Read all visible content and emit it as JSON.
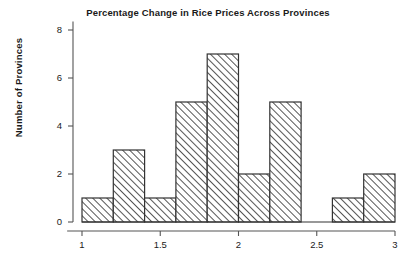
{
  "chart_data": {
    "type": "bar",
    "title": "Percentage Change in Rice Prices Across Provinces",
    "xlabel": "",
    "ylabel": "Number of Provinces",
    "bin_width": 0.2,
    "bin_edges": [
      1.0,
      1.2,
      1.4,
      1.6,
      1.8,
      2.0,
      2.2,
      2.4,
      2.6,
      2.8,
      3.0
    ],
    "categories": [
      "1.0-1.2",
      "1.2-1.4",
      "1.4-1.6",
      "1.6-1.8",
      "1.8-2.0",
      "2.0-2.2",
      "2.2-2.4",
      "2.4-2.6",
      "2.6-2.8",
      "2.8-3.0"
    ],
    "values": [
      1,
      3,
      1,
      5,
      7,
      2,
      5,
      0,
      1,
      2
    ],
    "xlim": [
      0.9,
      3.05
    ],
    "ylim": [
      0,
      8.35
    ],
    "xticks": [
      1,
      1.5,
      2,
      2.5,
      3
    ],
    "xtick_labels": [
      "1",
      "1.5",
      "2",
      "2.5",
      "3"
    ],
    "yticks": [
      0,
      2,
      4,
      6,
      8
    ],
    "ytick_labels": [
      "0",
      "2",
      "4",
      "6",
      "8"
    ],
    "grid": false,
    "legend": null,
    "bar_fill": "#ffffff",
    "bar_edge_color": "#333333",
    "hatch": "forward-diagonal",
    "hatch_color": "#2b2b2b",
    "axis_color": "#555555",
    "background": "#ffffff"
  }
}
